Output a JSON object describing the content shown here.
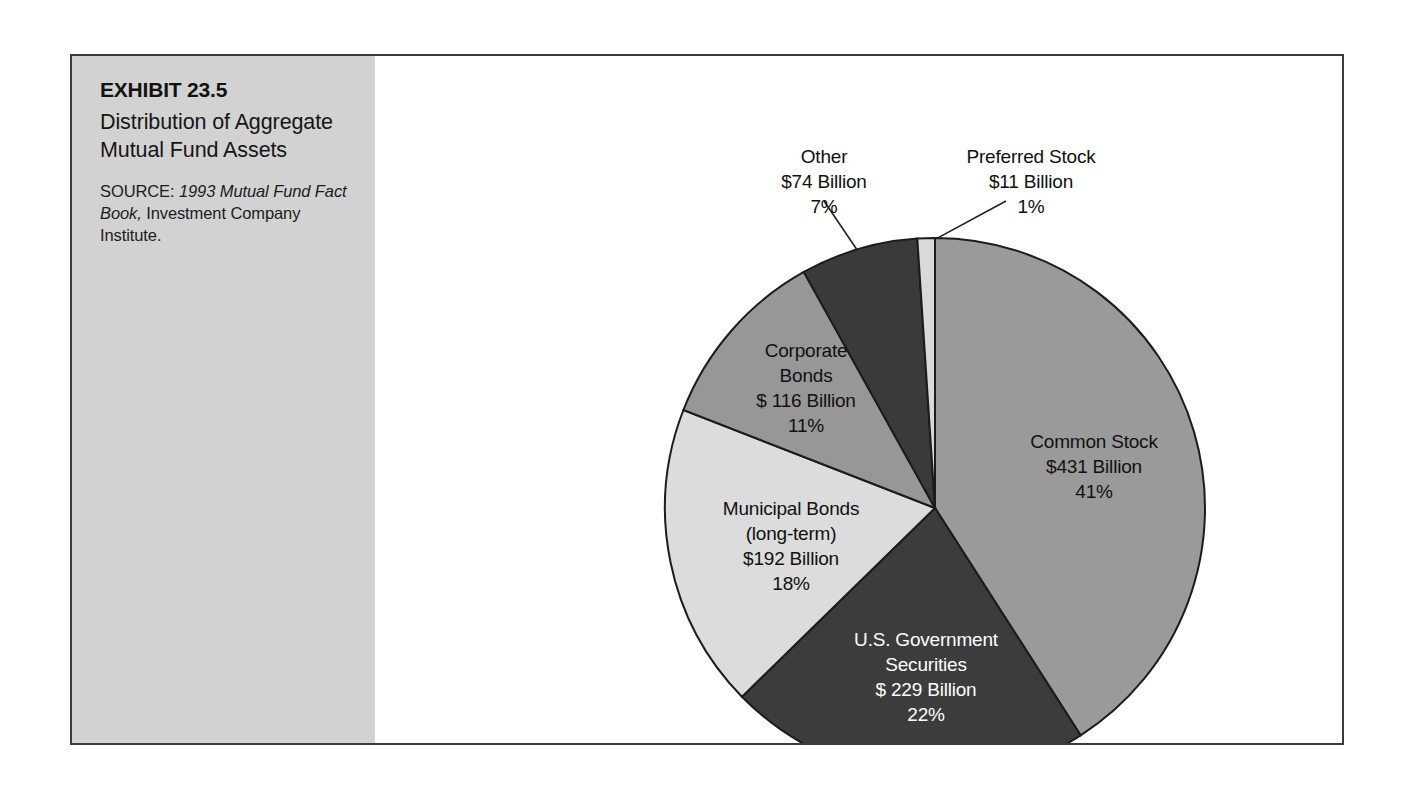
{
  "exhibit": {
    "number": "EXHIBIT 23.5",
    "title": "Distribution of Aggregate Mutual Fund Assets",
    "source_label": "SOURCE: ",
    "source_italic": "1993 Mutual Fund Fact Book,",
    "source_rest": " Investment Company Institute."
  },
  "chart_data": {
    "type": "pie",
    "title": "Distribution of Aggregate Mutual Fund Assets",
    "unit": "Billion USD",
    "total_label": "",
    "legend": "none",
    "grid": false,
    "start_angle_deg": 0,
    "direction": "clockwise",
    "categories": [
      "Common Stock",
      "U.S. Government Securities",
      "Municipal Bonds (long-term)",
      "Corporate Bonds",
      "Other",
      "Preferred Stock"
    ],
    "values": [
      431,
      229,
      192,
      116,
      74,
      11
    ],
    "percents": [
      41,
      22,
      18,
      11,
      7,
      1
    ],
    "colors": [
      "#9a9a9a",
      "#3c3c3c",
      "#dcdcdc",
      "#979797",
      "#3a3a3a",
      "#d9d9d9"
    ],
    "slices": [
      {
        "name": "Common Stock",
        "value": 431,
        "percent": 41,
        "color": "#9a9a9a",
        "label_placement": "inside",
        "text_color": "dark",
        "lines": [
          "Common Stock",
          "$431 Billion",
          "41%"
        ],
        "label_x": 1022,
        "label_y": 392
      },
      {
        "name": "U.S. Government Securities",
        "value": 229,
        "percent": 22,
        "color": "#3c3c3c",
        "label_placement": "inside",
        "text_color": "light",
        "lines": [
          "U.S. Government",
          "Securities",
          "$ 229 Billion",
          "22%"
        ],
        "label_x": 854,
        "label_y": 590
      },
      {
        "name": "Municipal Bonds (long-term)",
        "value": 192,
        "percent": 18,
        "color": "#dcdcdc",
        "label_placement": "inside",
        "text_color": "dark",
        "lines": [
          "Municipal Bonds",
          "(long-term)",
          "$192 Billion",
          "18%"
        ],
        "label_x": 719,
        "label_y": 459
      },
      {
        "name": "Corporate Bonds",
        "value": 116,
        "percent": 11,
        "color": "#979797",
        "label_placement": "inside",
        "text_color": "dark",
        "lines": [
          "Corporate",
          "Bonds",
          "$ 116 Billion",
          "11%"
        ],
        "label_x": 734,
        "label_y": 301
      },
      {
        "name": "Other",
        "value": 74,
        "percent": 7,
        "color": "#3a3a3a",
        "label_placement": "callout",
        "text_color": "dark",
        "lines": [
          "Other",
          "$74 Billion",
          "7%"
        ],
        "label_x": 752,
        "label_y": 107
      },
      {
        "name": "Preferred Stock",
        "value": 11,
        "percent": 1,
        "color": "#d9d9d9",
        "label_placement": "callout",
        "text_color": "dark",
        "lines": [
          "Preferred Stock",
          "$11 Billion",
          "1%"
        ],
        "label_x": 959,
        "label_y": 107
      }
    ],
    "geometry": {
      "center_x": 863,
      "center_y": 452,
      "radius": 270
    }
  }
}
